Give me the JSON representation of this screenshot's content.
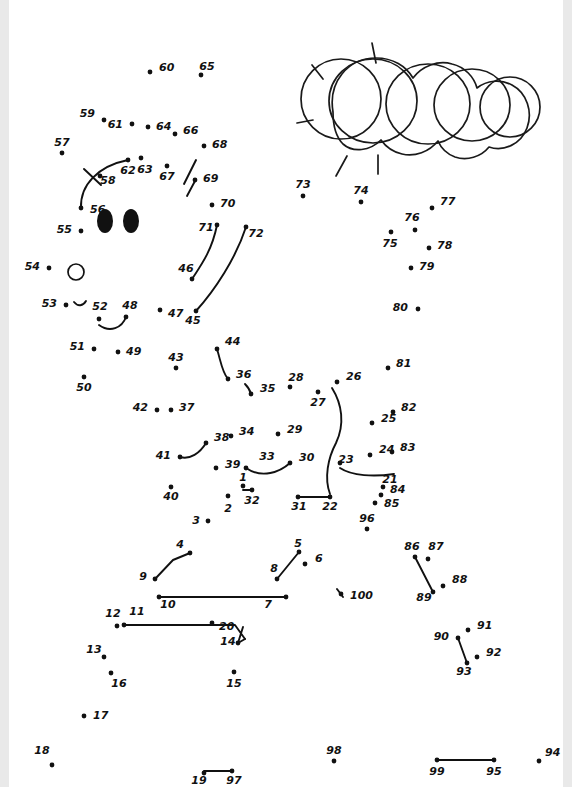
{
  "page": {
    "width": 572,
    "height": 787,
    "background_color": "#ffffff",
    "ink_color": "#111111"
  },
  "artwork": {
    "sun_label": "sun-with-rays",
    "cloud_label": "cloud",
    "eyes_label": "two-filled-oval-eyes",
    "hole_label": "small-open-circle",
    "ray_count": 5,
    "cloud_lobe_count": 4
  },
  "dots": [
    {
      "n": "1",
      "x": 243,
      "y": 486,
      "lx": 243,
      "ly": 481,
      "anchor": "middle"
    },
    {
      "n": "2",
      "x": 228,
      "y": 496,
      "lx": 228,
      "ly": 512,
      "anchor": "middle"
    },
    {
      "n": "3",
      "x": 208,
      "y": 521,
      "lx": 196,
      "ly": 524,
      "anchor": "middle"
    },
    {
      "n": "4",
      "x": 190,
      "y": 553,
      "lx": 180,
      "ly": 548,
      "anchor": "middle"
    },
    {
      "n": "5",
      "x": 299,
      "y": 552,
      "lx": 298,
      "ly": 547,
      "anchor": "middle"
    },
    {
      "n": "6",
      "x": 305,
      "y": 564,
      "lx": 315,
      "ly": 562,
      "anchor": "start"
    },
    {
      "n": "7",
      "x": 286,
      "y": 597,
      "lx": 268,
      "ly": 608,
      "anchor": "middle"
    },
    {
      "n": "8",
      "x": 277,
      "y": 579,
      "lx": 274,
      "ly": 572,
      "anchor": "middle"
    },
    {
      "n": "9",
      "x": 155,
      "y": 579,
      "lx": 147,
      "ly": 580,
      "anchor": "end"
    },
    {
      "n": "10",
      "x": 159,
      "y": 597,
      "lx": 168,
      "ly": 608,
      "anchor": "middle"
    },
    {
      "n": "11",
      "x": 124,
      "y": 625,
      "lx": 137,
      "ly": 615,
      "anchor": "middle"
    },
    {
      "n": "12",
      "x": 117,
      "y": 626,
      "lx": 113,
      "ly": 617,
      "anchor": "middle"
    },
    {
      "n": "13",
      "x": 104,
      "y": 657,
      "lx": 94,
      "ly": 653,
      "anchor": "middle"
    },
    {
      "n": "14",
      "x": 238,
      "y": 643,
      "lx": 228,
      "ly": 645,
      "anchor": "middle"
    },
    {
      "n": "15",
      "x": 234,
      "y": 672,
      "lx": 234,
      "ly": 687,
      "anchor": "middle"
    },
    {
      "n": "16",
      "x": 111,
      "y": 673,
      "lx": 119,
      "ly": 687,
      "anchor": "middle"
    },
    {
      "n": "17",
      "x": 84,
      "y": 716,
      "lx": 93,
      "ly": 719,
      "anchor": "start"
    },
    {
      "n": "18",
      "x": 52,
      "y": 765,
      "lx": 42,
      "ly": 754,
      "anchor": "middle"
    },
    {
      "n": "19",
      "x": 204,
      "y": 773,
      "lx": 199,
      "ly": 784,
      "anchor": "middle"
    },
    {
      "n": "20",
      "x": 212,
      "y": 623,
      "lx": 219,
      "ly": 630,
      "anchor": "start"
    },
    {
      "n": "21",
      "x": 383,
      "y": 487,
      "lx": 390,
      "ly": 483,
      "anchor": "middle"
    },
    {
      "n": "22",
      "x": 330,
      "y": 497,
      "lx": 330,
      "ly": 510,
      "anchor": "middle"
    },
    {
      "n": "23",
      "x": 340,
      "y": 463,
      "lx": 346,
      "ly": 463,
      "anchor": "middle"
    },
    {
      "n": "24",
      "x": 370,
      "y": 455,
      "lx": 379,
      "ly": 453,
      "anchor": "start"
    },
    {
      "n": "25",
      "x": 372,
      "y": 423,
      "lx": 381,
      "ly": 422,
      "anchor": "start"
    },
    {
      "n": "26",
      "x": 337,
      "y": 382,
      "lx": 346,
      "ly": 380,
      "anchor": "start"
    },
    {
      "n": "27",
      "x": 318,
      "y": 392,
      "lx": 318,
      "ly": 406,
      "anchor": "middle"
    },
    {
      "n": "28",
      "x": 290,
      "y": 387,
      "lx": 296,
      "ly": 381,
      "anchor": "middle"
    },
    {
      "n": "29",
      "x": 278,
      "y": 434,
      "lx": 287,
      "ly": 433,
      "anchor": "start"
    },
    {
      "n": "30",
      "x": 290,
      "y": 463,
      "lx": 299,
      "ly": 461,
      "anchor": "start"
    },
    {
      "n": "31",
      "x": 298,
      "y": 497,
      "lx": 299,
      "ly": 510,
      "anchor": "middle"
    },
    {
      "n": "32",
      "x": 252,
      "y": 490,
      "lx": 252,
      "ly": 504,
      "anchor": "middle"
    },
    {
      "n": "33",
      "x": 246,
      "y": 468,
      "lx": 267,
      "ly": 460,
      "anchor": "middle"
    },
    {
      "n": "34",
      "x": 231,
      "y": 436,
      "lx": 239,
      "ly": 435,
      "anchor": "start"
    },
    {
      "n": "35",
      "x": 251,
      "y": 394,
      "lx": 260,
      "ly": 392,
      "anchor": "start"
    },
    {
      "n": "36",
      "x": 228,
      "y": 379,
      "lx": 236,
      "ly": 378,
      "anchor": "start"
    },
    {
      "n": "37",
      "x": 171,
      "y": 410,
      "lx": 179,
      "ly": 411,
      "anchor": "start"
    },
    {
      "n": "38",
      "x": 206,
      "y": 443,
      "lx": 214,
      "ly": 441,
      "anchor": "start"
    },
    {
      "n": "39",
      "x": 216,
      "y": 468,
      "lx": 225,
      "ly": 468,
      "anchor": "start"
    },
    {
      "n": "40",
      "x": 171,
      "y": 487,
      "lx": 171,
      "ly": 500,
      "anchor": "middle"
    },
    {
      "n": "41",
      "x": 180,
      "y": 457,
      "lx": 171,
      "ly": 459,
      "anchor": "end"
    },
    {
      "n": "42",
      "x": 157,
      "y": 410,
      "lx": 148,
      "ly": 411,
      "anchor": "end"
    },
    {
      "n": "43",
      "x": 176,
      "y": 368,
      "lx": 176,
      "ly": 361,
      "anchor": "middle"
    },
    {
      "n": "44",
      "x": 217,
      "y": 349,
      "lx": 225,
      "ly": 345,
      "anchor": "start"
    },
    {
      "n": "45",
      "x": 196,
      "y": 311,
      "lx": 193,
      "ly": 324,
      "anchor": "middle"
    },
    {
      "n": "46",
      "x": 192,
      "y": 279,
      "lx": 186,
      "ly": 272,
      "anchor": "middle"
    },
    {
      "n": "47",
      "x": 160,
      "y": 310,
      "lx": 168,
      "ly": 317,
      "anchor": "start"
    },
    {
      "n": "48",
      "x": 126,
      "y": 317,
      "lx": 130,
      "ly": 309,
      "anchor": "middle"
    },
    {
      "n": "49",
      "x": 118,
      "y": 352,
      "lx": 126,
      "ly": 355,
      "anchor": "start"
    },
    {
      "n": "50",
      "x": 84,
      "y": 377,
      "lx": 84,
      "ly": 391,
      "anchor": "middle"
    },
    {
      "n": "51",
      "x": 94,
      "y": 349,
      "lx": 85,
      "ly": 350,
      "anchor": "end"
    },
    {
      "n": "52",
      "x": 99,
      "y": 319,
      "lx": 100,
      "ly": 310,
      "anchor": "middle"
    },
    {
      "n": "53",
      "x": 66,
      "y": 305,
      "lx": 57,
      "ly": 307,
      "anchor": "end"
    },
    {
      "n": "54",
      "x": 49,
      "y": 268,
      "lx": 40,
      "ly": 270,
      "anchor": "end"
    },
    {
      "n": "55",
      "x": 81,
      "y": 231,
      "lx": 72,
      "ly": 233,
      "anchor": "end"
    },
    {
      "n": "56",
      "x": 81,
      "y": 208,
      "lx": 90,
      "ly": 213,
      "anchor": "start"
    },
    {
      "n": "57",
      "x": 62,
      "y": 153,
      "lx": 62,
      "ly": 146,
      "anchor": "middle"
    },
    {
      "n": "58",
      "x": 100,
      "y": 176,
      "lx": 108,
      "ly": 184,
      "anchor": "middle"
    },
    {
      "n": "59",
      "x": 104,
      "y": 120,
      "lx": 95,
      "ly": 117,
      "anchor": "end"
    },
    {
      "n": "60",
      "x": 150,
      "y": 72,
      "lx": 159,
      "ly": 71,
      "anchor": "start"
    },
    {
      "n": "61",
      "x": 132,
      "y": 124,
      "lx": 123,
      "ly": 128,
      "anchor": "end"
    },
    {
      "n": "62",
      "x": 128,
      "y": 160,
      "lx": 128,
      "ly": 174,
      "anchor": "middle"
    },
    {
      "n": "63",
      "x": 141,
      "y": 158,
      "lx": 145,
      "ly": 173,
      "anchor": "middle"
    },
    {
      "n": "64",
      "x": 148,
      "y": 127,
      "lx": 156,
      "ly": 130,
      "anchor": "start"
    },
    {
      "n": "65",
      "x": 201,
      "y": 75,
      "lx": 207,
      "ly": 70,
      "anchor": "middle"
    },
    {
      "n": "66",
      "x": 175,
      "y": 134,
      "lx": 183,
      "ly": 134,
      "anchor": "start"
    },
    {
      "n": "67",
      "x": 167,
      "y": 166,
      "lx": 167,
      "ly": 180,
      "anchor": "middle"
    },
    {
      "n": "68",
      "x": 204,
      "y": 146,
      "lx": 212,
      "ly": 148,
      "anchor": "start"
    },
    {
      "n": "69",
      "x": 195,
      "y": 180,
      "lx": 203,
      "ly": 182,
      "anchor": "start"
    },
    {
      "n": "70",
      "x": 212,
      "y": 205,
      "lx": 220,
      "ly": 207,
      "anchor": "start"
    },
    {
      "n": "71",
      "x": 217,
      "y": 225,
      "lx": 206,
      "ly": 231,
      "anchor": "middle"
    },
    {
      "n": "72",
      "x": 246,
      "y": 227,
      "lx": 256,
      "ly": 237,
      "anchor": "middle"
    },
    {
      "n": "73",
      "x": 303,
      "y": 196,
      "lx": 303,
      "ly": 188,
      "anchor": "middle"
    },
    {
      "n": "74",
      "x": 361,
      "y": 202,
      "lx": 361,
      "ly": 194,
      "anchor": "middle"
    },
    {
      "n": "75",
      "x": 391,
      "y": 232,
      "lx": 390,
      "ly": 247,
      "anchor": "middle"
    },
    {
      "n": "76",
      "x": 415,
      "y": 230,
      "lx": 412,
      "ly": 221,
      "anchor": "middle"
    },
    {
      "n": "77",
      "x": 432,
      "y": 208,
      "lx": 440,
      "ly": 205,
      "anchor": "start"
    },
    {
      "n": "78",
      "x": 429,
      "y": 248,
      "lx": 437,
      "ly": 249,
      "anchor": "start"
    },
    {
      "n": "79",
      "x": 411,
      "y": 268,
      "lx": 419,
      "ly": 270,
      "anchor": "start"
    },
    {
      "n": "80",
      "x": 418,
      "y": 309,
      "lx": 408,
      "ly": 311,
      "anchor": "end"
    },
    {
      "n": "81",
      "x": 388,
      "y": 368,
      "lx": 396,
      "ly": 367,
      "anchor": "start"
    },
    {
      "n": "82",
      "x": 393,
      "y": 412,
      "lx": 401,
      "ly": 411,
      "anchor": "start"
    },
    {
      "n": "83",
      "x": 392,
      "y": 452,
      "lx": 400,
      "ly": 451,
      "anchor": "start"
    },
    {
      "n": "84",
      "x": 381,
      "y": 495,
      "lx": 390,
      "ly": 493,
      "anchor": "start"
    },
    {
      "n": "85",
      "x": 375,
      "y": 503,
      "lx": 384,
      "ly": 507,
      "anchor": "start"
    },
    {
      "n": "86",
      "x": 415,
      "y": 557,
      "lx": 412,
      "ly": 550,
      "anchor": "middle"
    },
    {
      "n": "87",
      "x": 428,
      "y": 559,
      "lx": 436,
      "ly": 550,
      "anchor": "middle"
    },
    {
      "n": "88",
      "x": 443,
      "y": 586,
      "lx": 452,
      "ly": 583,
      "anchor": "start"
    },
    {
      "n": "89",
      "x": 433,
      "y": 592,
      "lx": 424,
      "ly": 601,
      "anchor": "middle"
    },
    {
      "n": "90",
      "x": 458,
      "y": 638,
      "lx": 449,
      "ly": 640,
      "anchor": "end"
    },
    {
      "n": "91",
      "x": 468,
      "y": 630,
      "lx": 477,
      "ly": 629,
      "anchor": "start"
    },
    {
      "n": "92",
      "x": 477,
      "y": 657,
      "lx": 486,
      "ly": 656,
      "anchor": "start"
    },
    {
      "n": "93",
      "x": 467,
      "y": 663,
      "lx": 464,
      "ly": 675,
      "anchor": "middle"
    },
    {
      "n": "94",
      "x": 539,
      "y": 761,
      "lx": 545,
      "ly": 756,
      "anchor": "start"
    },
    {
      "n": "95",
      "x": 494,
      "y": 760,
      "lx": 494,
      "ly": 775,
      "anchor": "middle"
    },
    {
      "n": "96",
      "x": 367,
      "y": 529,
      "lx": 367,
      "ly": 522,
      "anchor": "middle"
    },
    {
      "n": "97",
      "x": 232,
      "y": 771,
      "lx": 234,
      "ly": 784,
      "anchor": "middle"
    },
    {
      "n": "98",
      "x": 334,
      "y": 761,
      "lx": 334,
      "ly": 754,
      "anchor": "middle"
    },
    {
      "n": "99",
      "x": 437,
      "y": 760,
      "lx": 437,
      "ly": 775,
      "anchor": "middle"
    },
    {
      "n": "100",
      "x": 341,
      "y": 594,
      "lx": 350,
      "ly": 599,
      "anchor": "start"
    }
  ],
  "segments": [
    {
      "name": "seg-1-32",
      "d": "M 243 490 L 252 490"
    },
    {
      "name": "seg-9-4",
      "d": "M 155 579 L 173 560 L 190 553"
    },
    {
      "name": "seg-10-7",
      "d": "M 159 597 L 286 597"
    },
    {
      "name": "seg-11-14",
      "d": "M 124 625 L 235 625 L 245 639 M 238 643 L 243 627"
    },
    {
      "name": "seg-8-5",
      "d": "M 277 579 L 299 552"
    },
    {
      "name": "seg-31-22",
      "d": "M 298 497 L 330 497"
    },
    {
      "name": "seg-86-89",
      "d": "M 415 557 L 433 592"
    },
    {
      "name": "seg-90-93",
      "d": "M 458 638 L 467 663"
    },
    {
      "name": "seg-19-97",
      "d": "M 204 771 L 232 771"
    },
    {
      "name": "seg-99-95",
      "d": "M 437 760 L 494 760"
    }
  ],
  "curves": [
    {
      "name": "curve-56-62",
      "d": "M 81 208 C 80 185 98 166 128 160"
    },
    {
      "name": "curve-58-tick",
      "d": "M 84 169 L 101 185"
    },
    {
      "name": "curve-69-upper",
      "d": "M 196 160 L 184 184"
    },
    {
      "name": "curve-69-lower",
      "d": "M 195 181 L 187 196"
    },
    {
      "name": "curve-71-46",
      "d": "M 217 225 C 212 250 202 264 192 279"
    },
    {
      "name": "curve-72-45",
      "d": "M 246 227 C 236 258 215 290 196 311"
    },
    {
      "name": "curve-52-48",
      "d": "M 99 325 C 110 333 122 328 126 317"
    },
    {
      "name": "curve-53-tick",
      "d": "M 74 302 C 78 307 83 306 86 301"
    },
    {
      "name": "curve-44-36",
      "d": "M 217 349 C 221 362 222 372 228 379"
    },
    {
      "name": "curve-36-35",
      "d": "M 245 384 C 248 387 250 390 251 394"
    },
    {
      "name": "curve-41-38",
      "d": "M 180 457 C 190 460 200 453 206 443"
    },
    {
      "name": "curve-33-30",
      "d": "M 246 468 C 262 479 280 472 290 463"
    },
    {
      "name": "curve-26-22",
      "d": "M 332 388 C 342 404 345 424 336 443 C 328 458 324 478 330 494"
    },
    {
      "name": "curve-23-21",
      "d": "M 340 468 C 352 476 374 477 394 474"
    },
    {
      "name": "curve-100-hook",
      "d": "M 337 589 L 343 597"
    },
    {
      "name": "curve-14-peak",
      "d": "M 245 639 L 238 643"
    }
  ],
  "sun": {
    "cx": 341,
    "cy": 99,
    "r": 40,
    "rays": [
      {
        "name": "ray-top",
        "d": "M 372 43 L 376 63"
      },
      {
        "name": "ray-upper-left",
        "d": "M 312 65 L 323 79"
      },
      {
        "name": "ray-left",
        "d": "M 297 123 L 313 120"
      },
      {
        "name": "ray-lower-left",
        "d": "M 336 176 L 347 156"
      },
      {
        "name": "ray-bottom",
        "d": "M 378 174 L 378 155"
      }
    ]
  },
  "cloud": {
    "lobes": [
      {
        "name": "cloud-lobe-1",
        "cx": 373,
        "cy": 101,
        "rx": 44,
        "ry": 42
      },
      {
        "name": "cloud-lobe-2",
        "cx": 428,
        "cy": 104,
        "rx": 42,
        "ry": 40
      },
      {
        "name": "cloud-lobe-3",
        "cx": 472,
        "cy": 105,
        "rx": 38,
        "ry": 36
      },
      {
        "name": "cloud-lobe-4",
        "cx": 510,
        "cy": 107,
        "rx": 30,
        "ry": 30
      }
    ],
    "outline": "M 333 112 C 328 82 348 58 376 58 C 393 58 406 66 413 78 C 422 66 438 60 452 64 C 465 67 474 77 477 88 C 487 80 501 79 512 85 C 527 93 533 112 527 128 C 521 144 504 152 489 147 C 481 157 467 161 455 157 C 447 154 441 148 438 141 C 429 152 415 157 402 154 C 393 152 386 147 381 140 C 370 151 353 153 343 144 C 336 137 333 125 333 112 Z"
  },
  "face": {
    "eye_left": {
      "cx": 105,
      "cy": 221,
      "rx": 8,
      "ry": 12
    },
    "eye_right": {
      "cx": 131,
      "cy": 221,
      "rx": 8,
      "ry": 12
    },
    "hole": {
      "cx": 76,
      "cy": 272,
      "rx": 8,
      "ry": 8
    }
  }
}
